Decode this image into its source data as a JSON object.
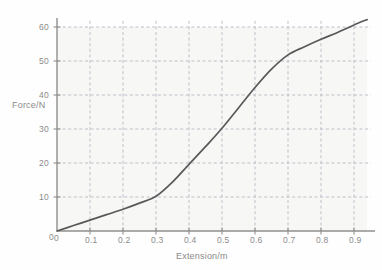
{
  "chart_data": {
    "type": "line",
    "title": "",
    "xlabel": "Extension/m",
    "ylabel": "Force/N",
    "xlim": [
      0,
      0.95
    ],
    "ylim": [
      0,
      64
    ],
    "grid": true,
    "legend": null,
    "x_ticks": [
      "0",
      "0.1",
      "0.2",
      "0.3",
      "0.4",
      "0.5",
      "0.6",
      "0.7",
      "0.8",
      "0.9"
    ],
    "x_tick_values": [
      0,
      0.1,
      0.2,
      0.3,
      0.4,
      0.5,
      0.6,
      0.7,
      0.8,
      0.9
    ],
    "y_ticks": [
      "0",
      "10",
      "20",
      "30",
      "40",
      "50",
      "60"
    ],
    "y_tick_values": [
      0,
      10,
      20,
      30,
      40,
      50,
      60
    ],
    "series": [
      {
        "name": "force-extension",
        "color": "#595959",
        "x": [
          0.0,
          0.05,
          0.1,
          0.15,
          0.2,
          0.25,
          0.3,
          0.35,
          0.4,
          0.45,
          0.5,
          0.55,
          0.6,
          0.65,
          0.7,
          0.75,
          0.8,
          0.85,
          0.9,
          0.94
        ],
        "y": [
          0.0,
          1.6,
          3.2,
          4.8,
          6.4,
          8.2,
          10.2,
          14.4,
          19.6,
          24.8,
          30.2,
          36.2,
          42.2,
          47.6,
          51.8,
          54.2,
          56.4,
          58.4,
          60.6,
          62.2
        ]
      }
    ]
  },
  "axis_labels": {
    "y_axis_title": "Force/N",
    "x_axis_title": "Extension/m"
  },
  "style": {
    "curve_color": "#595959",
    "axis_color": "#8f8f8f",
    "grid_color": "#b9b9c4",
    "tick_text_color": "#8c8c8c",
    "background": "#fefefe"
  }
}
